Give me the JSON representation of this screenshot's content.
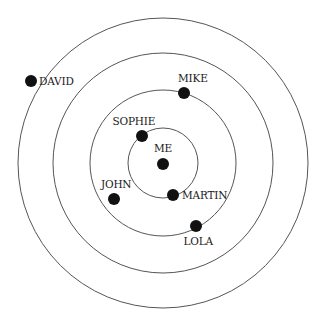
{
  "diagram": {
    "type": "concentric-social-circles",
    "center": {
      "x": 163,
      "y": 163
    },
    "rings": [
      {
        "radius": 35
      },
      {
        "radius": 73
      },
      {
        "radius": 110
      },
      {
        "radius": 145
      }
    ],
    "colors": {
      "ring": "#555555",
      "node": "#111111",
      "background": "#ffffff"
    },
    "nodes": [
      {
        "id": "me",
        "label": "ME",
        "x": 163,
        "y": 164,
        "label_x": 163,
        "label_y": 148,
        "anchor": "middle"
      },
      {
        "id": "sophie",
        "label": "SOPHIE",
        "x": 142,
        "y": 136,
        "label_x": 134,
        "label_y": 121,
        "anchor": "middle"
      },
      {
        "id": "martin",
        "label": "MARTIN",
        "x": 173,
        "y": 195,
        "label_x": 182,
        "label_y": 195,
        "anchor": "start"
      },
      {
        "id": "john",
        "label": "JOHN",
        "x": 114,
        "y": 199,
        "label_x": 116,
        "label_y": 184,
        "anchor": "middle"
      },
      {
        "id": "mike",
        "label": "MIKE",
        "x": 184,
        "y": 93,
        "label_x": 193,
        "label_y": 78,
        "anchor": "middle"
      },
      {
        "id": "lola",
        "label": "LOLA",
        "x": 196,
        "y": 226,
        "label_x": 198,
        "label_y": 241,
        "anchor": "middle"
      },
      {
        "id": "david",
        "label": "DAVID",
        "x": 31,
        "y": 81,
        "label_x": 39,
        "label_y": 81,
        "anchor": "start"
      }
    ],
    "node_radius": 6
  }
}
